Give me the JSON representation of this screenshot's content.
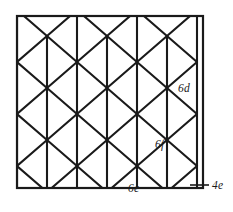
{
  "figure": {
    "frame": {
      "x": 17,
      "y": 16,
      "width": 186,
      "height": 172,
      "stroke_color": "#1a1a1a"
    },
    "lattice": {
      "type": "rhombille",
      "description": "tumbling-block / cube tiling of 60-120 degree rhombi",
      "horizontal_pitch": 60,
      "vertical_pitch": 52,
      "edge_color": "#1a1a1a",
      "background_color": "#ffffff"
    },
    "labels": [
      {
        "id": "label-6d",
        "text": "6d",
        "x": 178,
        "y": 92,
        "anchor": "start",
        "has_leader": false
      },
      {
        "id": "label-6f",
        "text": "6f",
        "x": 155,
        "y": 148,
        "anchor": "start",
        "has_leader": false
      },
      {
        "id": "label-6e",
        "text": "6e",
        "x": 128,
        "y": 192,
        "anchor": "start",
        "has_leader": false
      },
      {
        "id": "label-4e",
        "text": "4e",
        "x": 212,
        "y": 189,
        "anchor": "start",
        "has_leader": true,
        "leader": {
          "x1": 190,
          "y1": 185,
          "x2": 209,
          "y2": 185
        }
      }
    ]
  }
}
